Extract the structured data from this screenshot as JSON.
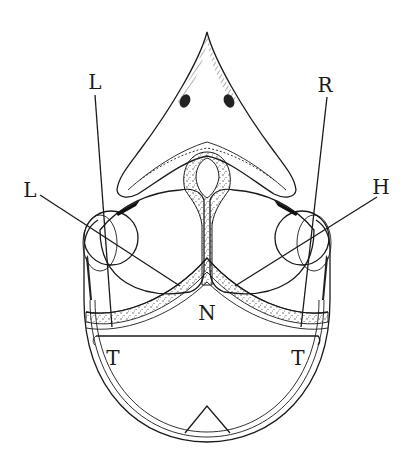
{
  "figure": {
    "type": "anatomical cross-section line drawing",
    "background": "#ffffff",
    "ink_color": "#1a1a1a"
  },
  "labels": [
    {
      "id": "L-upper",
      "text": "L",
      "x": 95,
      "y": 82
    },
    {
      "id": "L-left",
      "text": "L",
      "x": 30,
      "y": 190
    },
    {
      "id": "R",
      "text": "R",
      "x": 325,
      "y": 85
    },
    {
      "id": "H",
      "text": "H",
      "x": 381,
      "y": 187
    },
    {
      "id": "N",
      "text": "N",
      "x": 207,
      "y": 313
    },
    {
      "id": "T-left",
      "text": "T",
      "x": 113,
      "y": 358
    },
    {
      "id": "T-right",
      "text": "T",
      "x": 298,
      "y": 358
    }
  ],
  "leader_lines": [
    {
      "from_label": "L-upper",
      "x1": 95,
      "y1": 95,
      "x2": 112,
      "y2": 327
    },
    {
      "from_label": "L-left",
      "x1": 40,
      "y1": 195,
      "x2": 180,
      "y2": 286
    },
    {
      "from_label": "R",
      "x1": 327,
      "y1": 97,
      "x2": 301,
      "y2": 327
    },
    {
      "from_label": "H",
      "x1": 377,
      "y1": 197,
      "x2": 235,
      "y2": 286
    }
  ]
}
